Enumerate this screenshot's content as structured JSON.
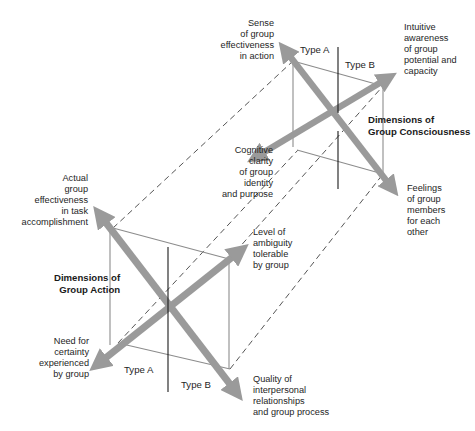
{
  "upper_figure": {
    "title": "Dimensions of\nGroup Consciousness",
    "type_a": "Type A",
    "type_b": "Type B",
    "labels": {
      "nw": "Sense\nof group\neffectiveness\nin action",
      "ne": "Intuitive\nawareness\nof group\npotential and\ncapacity",
      "sw": "Cognitive\nclarity\nof group\nidentity\nand purpose",
      "se": "Feelings\nof group\nmembers\nfor each\nother"
    }
  },
  "lower_figure": {
    "title": "Dimensions of\nGroup Action",
    "type_a": "Type A",
    "type_b": "Type B",
    "labels": {
      "nw": "Actual\ngroup\neffectiveness\nin task\naccomplishment",
      "ne": "Level of\nambiguity\ntolerable\nby group",
      "sw": "Need for\ncertainty\nexperienced\nby group",
      "se": "Quality of\ninterpersonal\nrelationships\nand group process"
    }
  },
  "colors": {
    "arrow": "#9a9a9a",
    "frame_line": "#8c8c8c",
    "axis_line": "#1a1a1a",
    "dashed_line": "#2a2a2a"
  }
}
